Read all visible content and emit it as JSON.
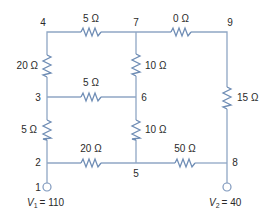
{
  "diagram": {
    "type": "resistor-network",
    "nodes": [
      {
        "id": "1",
        "label": "1"
      },
      {
        "id": "2",
        "label": "2"
      },
      {
        "id": "3",
        "label": "3"
      },
      {
        "id": "4",
        "label": "4"
      },
      {
        "id": "5",
        "label": "5"
      },
      {
        "id": "6",
        "label": "6"
      },
      {
        "id": "7",
        "label": "7"
      },
      {
        "id": "8",
        "label": "8"
      },
      {
        "id": "9",
        "label": "9"
      }
    ],
    "resistors": [
      {
        "from": "4",
        "to": "7",
        "label": "5 Ω"
      },
      {
        "from": "7",
        "to": "9",
        "label": "0 Ω"
      },
      {
        "from": "4",
        "to": "3",
        "label": "20 Ω"
      },
      {
        "from": "7",
        "to": "6",
        "label": "10 Ω"
      },
      {
        "from": "3",
        "to": "6",
        "label": "5 Ω"
      },
      {
        "from": "9",
        "to": "8",
        "label": "15 Ω"
      },
      {
        "from": "3",
        "to": "2",
        "label": "5 Ω"
      },
      {
        "from": "6",
        "to": "5",
        "label": "10 Ω"
      },
      {
        "from": "2",
        "to": "5",
        "label": "20 Ω"
      },
      {
        "from": "5",
        "to": "8",
        "label": "50 Ω"
      }
    ],
    "sources": [
      {
        "node": "1",
        "symbol": "V",
        "subscript": "1",
        "value": "= 110"
      },
      {
        "node": "8",
        "symbol": "V",
        "subscript": "2",
        "value": "= 40"
      }
    ]
  }
}
